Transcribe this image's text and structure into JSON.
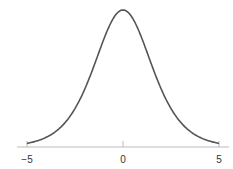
{
  "chart_data": {
    "type": "line",
    "title": "",
    "xlabel": "",
    "ylabel": "",
    "xlim": [
      -5,
      5
    ],
    "x_ticks": [
      -5,
      0,
      5
    ],
    "x_tick_labels": [
      "−5",
      "0",
      "5"
    ],
    "grid": false,
    "legend": null,
    "series": [
      {
        "name": "density",
        "description": "Symmetric bell-shaped density curve centered at 0 with heavy tails (logistic-like)",
        "x": [
          -5,
          -4,
          -3,
          -2,
          -1,
          0,
          1,
          2,
          3,
          4,
          5
        ],
        "y": [
          0.0066,
          0.0177,
          0.0452,
          0.105,
          0.1966,
          0.25,
          0.1966,
          0.105,
          0.0452,
          0.0177,
          0.0066
        ]
      }
    ],
    "colors": {
      "line": "#555555",
      "axis": "#bbbbbb"
    }
  }
}
